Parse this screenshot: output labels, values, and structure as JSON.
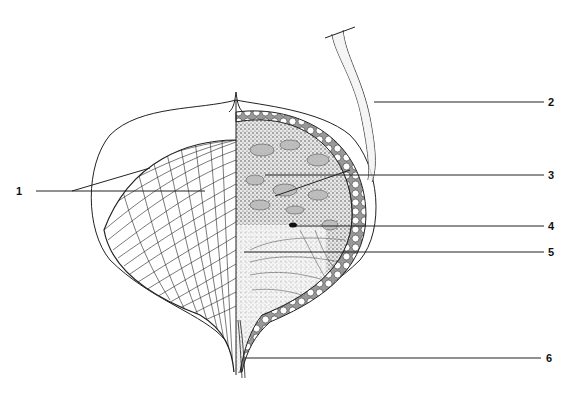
{
  "diagram": {
    "type": "anatomical illustration",
    "labels": [
      {
        "id": "1",
        "text": "1",
        "x": 16,
        "y": 190
      },
      {
        "id": "2",
        "text": "2",
        "x": 548,
        "y": 97
      },
      {
        "id": "3",
        "text": "3",
        "x": 548,
        "y": 170
      },
      {
        "id": "4",
        "text": "4",
        "x": 548,
        "y": 221
      },
      {
        "id": "5",
        "text": "5",
        "x": 548,
        "y": 247
      },
      {
        "id": "6",
        "text": "6",
        "x": 546,
        "y": 352
      }
    ],
    "colors": {
      "line": "#222222",
      "background": "#ffffff",
      "stipple": "#555555"
    }
  }
}
